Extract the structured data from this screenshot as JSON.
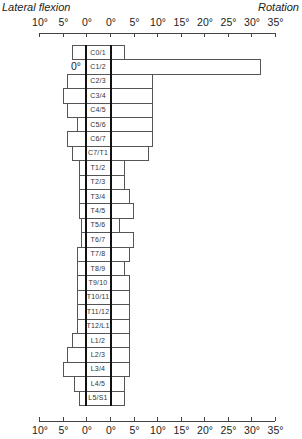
{
  "chart_data": {
    "type": "bar",
    "orientation": "horizontal-diverging",
    "title_left": "Lateral flexion",
    "title_right": "Rotation",
    "axis_ticks_left": [
      "10°",
      "5°",
      "0°"
    ],
    "axis_ticks_right": [
      "0°",
      "5°",
      "10°",
      "15°",
      "20°",
      "25°",
      "30°",
      "35°"
    ],
    "xlim_left": [
      10,
      0
    ],
    "xlim_right": [
      0,
      35
    ],
    "unit": "degrees",
    "grid": false,
    "legend": null,
    "annotation": "0°",
    "categories": [
      "C0/1",
      "C1/2",
      "C2/3",
      "C3/4",
      "C4/5",
      "C5/6",
      "C6/7",
      "C7/T1",
      "T1/2",
      "T2/3",
      "T3/4",
      "T4/5",
      "T5/6",
      "T6/7",
      "T7/8",
      "T8/9",
      "T9/10",
      "T10/11",
      "T11/12",
      "T12/L1",
      "L1/2",
      "L2/3",
      "L3/4",
      "L4/5",
      "L5/S1"
    ],
    "series": [
      {
        "name": "Lateral flexion",
        "values": [
          3,
          0,
          4,
          5,
          4,
          2,
          4,
          3,
          1.5,
          1.5,
          1.5,
          1.5,
          1,
          1,
          2,
          2,
          2,
          2,
          2,
          2,
          3,
          4,
          5,
          2.5,
          1.5
        ]
      },
      {
        "name": "Rotation",
        "values": [
          3,
          32,
          9,
          9,
          9,
          9,
          9,
          8,
          3,
          3,
          4,
          5,
          2,
          5,
          4,
          3,
          4,
          4,
          4,
          4,
          4,
          4,
          4,
          3,
          3
        ]
      }
    ]
  }
}
